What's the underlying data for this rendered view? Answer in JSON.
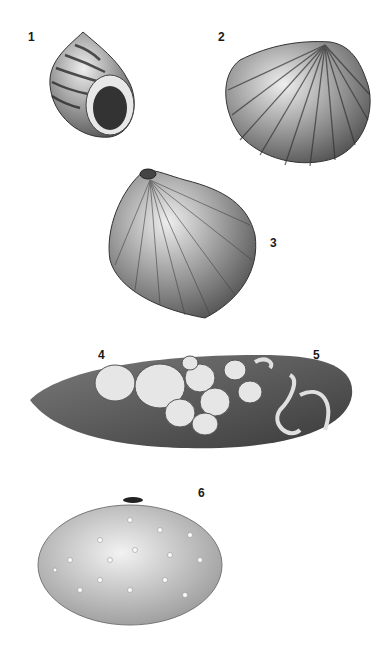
{
  "plate": {
    "figures": [
      {
        "number": "1",
        "subject": "periwinkle snail shell (aperture view)"
      },
      {
        "number": "2",
        "subject": "cockle shell"
      },
      {
        "number": "3",
        "subject": "bivalve shell with bored hole"
      },
      {
        "number": "4",
        "subject": "acorn barnacles"
      },
      {
        "number": "5",
        "subject": "tube worm casings"
      },
      {
        "number": "6",
        "subject": "sea urchin test"
      }
    ]
  },
  "colors": {
    "background": "#ffffff",
    "ink": "#1a1a1a"
  }
}
